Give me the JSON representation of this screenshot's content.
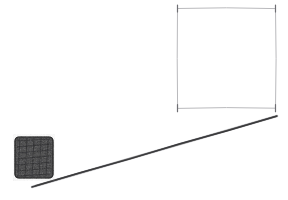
{
  "figure": {
    "style": "hand-drawn pencil sketch",
    "background_color": "#ffffff",
    "width": 288,
    "height": 200
  },
  "palette": {
    "background": "#ffffff",
    "square_edge": "#b9b9bc",
    "square_corner": "#6e6e73",
    "incline_line": "#3a3a3c",
    "block_fill": "#3c3c3e",
    "block_outline": "#2a2a2c"
  },
  "shapes": {
    "square": {
      "name": "square-outline",
      "label": "",
      "x": 177,
      "y": 8,
      "width": 98,
      "height": 100,
      "stroke": "#b9b9bc",
      "fill": "none",
      "corner_tick_stroke": "#6e6e73",
      "corner_tick_length": 7
    },
    "incline": {
      "name": "incline-line",
      "label": "",
      "x1": 32,
      "y1": 187,
      "x2": 277,
      "y2": 116,
      "stroke": "#3a3a3c",
      "stroke_width": 1.5
    },
    "block": {
      "name": "shaded-block",
      "label": "",
      "x": 15,
      "y": 137,
      "width": 38,
      "height": 41,
      "corner_radius": 4,
      "fill": "#3c3c3e",
      "texture": "dense-scribble"
    }
  },
  "annotations": {
    "text_labels": [],
    "has_axes": false,
    "has_legend": false
  }
}
